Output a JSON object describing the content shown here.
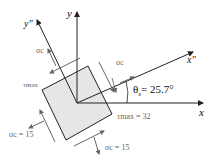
{
  "diagram": {
    "type": "stress element rotated to maximum shear stress orientation",
    "axes": {
      "x": "x",
      "y": "y",
      "x_rot": "x\"",
      "y_rot": "y\""
    },
    "angle_label": "θs = 25.7°",
    "angle_symbol": "θ",
    "angle_sub": "s",
    "angle_value": "= 25.7°",
    "labels": {
      "sigma_top": "σc",
      "sigma_right": "σc",
      "tau_left": "τmax",
      "tau_right": "τmax = 32",
      "sigma_bottom_left": "σc = 15",
      "sigma_bottom": "σc = 15"
    },
    "values": {
      "tau_max": 32,
      "sigma_c": 15,
      "theta_s_deg": 25.7
    },
    "colors": {
      "element_fill": "#e6e6e6",
      "line": "#222222",
      "arrow": "#555555"
    }
  }
}
